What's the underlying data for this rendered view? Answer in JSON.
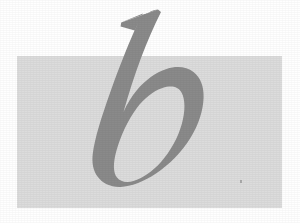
{
  "image": {
    "kind": "typographic-specimen",
    "width": 300,
    "height": 223,
    "canvas_color": "#ffffff",
    "description": "Lowercase italic serif letter b over a light grey rectangle"
  },
  "backdrop": {
    "name": "grey-panel",
    "color": "#dcdcdc",
    "x": 17,
    "y": 56,
    "width": 265,
    "height": 152
  },
  "glyph": {
    "character": "b",
    "case": "lowercase",
    "style": "italic",
    "classification": "serif",
    "color": "#8a8a8a",
    "outline_color": "#8a8a8a",
    "ascender_top_y": 10,
    "baseline_y": 190,
    "left_x": 88,
    "right_x": 204
  },
  "marks": {
    "speck": {
      "name": "dust-speck",
      "color": "#9a9a9a",
      "x": 240,
      "y": 180
    }
  },
  "caption": {
    "text": "b"
  }
}
